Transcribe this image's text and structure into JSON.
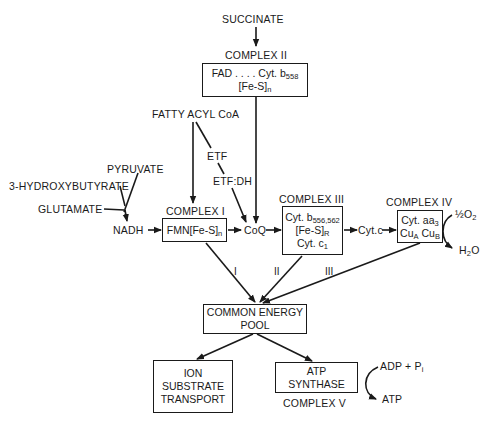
{
  "inputs": {
    "succinate": "SUCCINATE",
    "fatty_acyl_coa": "FATTY ACYL CoA",
    "pyruvate": "PYRUVATE",
    "hydroxybutyrate": "3-HYDROXYBUTYRATE",
    "glutamate": "GLUTAMATE",
    "nadh": "NADH"
  },
  "carriers": {
    "etf": "ETF",
    "etf_dh": "ETF:DH",
    "coq": "CoQ",
    "cyt_c": "Cyt.c"
  },
  "complex_ii": {
    "title": "COMPLEX II",
    "line1": "FAD . . . . Cyt. b",
    "line1_sub": "558",
    "line2": "[Fe-S]",
    "line2_sub": "n"
  },
  "complex_i": {
    "title": "COMPLEX I",
    "line1": "FMN[Fe-S]",
    "line1_sub": "n"
  },
  "complex_iii": {
    "title": "COMPLEX III",
    "line1": "Cyt. b",
    "line1_sub": "556,562",
    "line2": "[Fe-S]",
    "line2_sub": "R",
    "line3": "Cyt. c",
    "line3_sub": "1"
  },
  "complex_iv": {
    "title": "COMPLEX IV",
    "line1": "Cyt. aa",
    "line1_sub": "3",
    "line2a": "Cu",
    "line2a_sub": "A",
    "line2b": " Cu",
    "line2b_sub": "B",
    "o2": "½O",
    "o2_sub": "2",
    "h2o_a": "H",
    "h2o_sub": "2",
    "h2o_b": "O"
  },
  "sites": [
    "I",
    "II",
    "III"
  ],
  "energy_pool": {
    "line1": "COMMON ENERGY",
    "line2": "POOL"
  },
  "ion_transport": {
    "line1": "ION",
    "line2": "SUBSTRATE",
    "line3": "TRANSPORT"
  },
  "atp_synthase": {
    "line1": "ATP",
    "line2": "SYNTHASE",
    "title": "COMPLEX V",
    "adp": "ADP + P",
    "adp_sub": "i",
    "atp": "ATP"
  },
  "colors": {
    "ink": "#1a1a1a",
    "background": "#ffffff"
  }
}
